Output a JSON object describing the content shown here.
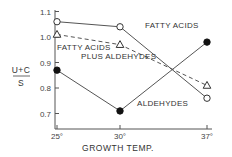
{
  "chart_data": {
    "type": "line",
    "title": "",
    "xlabel": "GROWTH TEMP.",
    "ylabel_numerator": "U+C",
    "ylabel_denominator": "S",
    "ylabel": "(U+C)/S",
    "x": [
      "25°",
      "30°",
      "37°"
    ],
    "x_values": [
      25,
      30,
      37
    ],
    "ylim": [
      0.66,
      1.12
    ],
    "yticks": [
      "0.7",
      "0.8",
      "0.9",
      "1.0",
      "1.1"
    ],
    "ytick_values": [
      0.7,
      0.8,
      0.9,
      1.0,
      1.1
    ],
    "grid": false,
    "legend": "inline labels",
    "series": [
      {
        "name": "FATTY ACIDS",
        "marker": "open-circle",
        "linestyle": "solid",
        "values": [
          1.06,
          1.04,
          0.76
        ]
      },
      {
        "name": "FATTY ACIDS PLUS ALDEHYDES",
        "label_line1": "FATTY ACIDS",
        "label_line2": "PLUS ALDEHYDES",
        "marker": "open-triangle",
        "linestyle": "dashed",
        "values": [
          1.01,
          0.97,
          0.81
        ]
      },
      {
        "name": "ALDEHYDES",
        "marker": "filled-circle",
        "linestyle": "solid",
        "values": [
          0.87,
          0.71,
          0.98
        ]
      }
    ]
  },
  "colors": {
    "line": "#555555",
    "marker_fill": "#111111",
    "text": "#333333"
  }
}
